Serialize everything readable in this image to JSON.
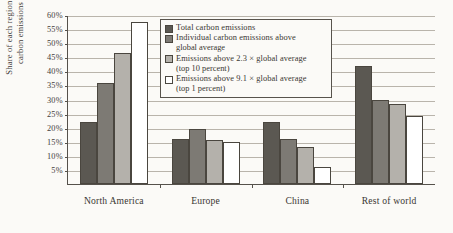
{
  "chart_data": {
    "type": "bar",
    "title": "",
    "xlabel": "",
    "ylabel": "Share of each region in carbon emissions",
    "ylabel_lines": [
      "Share of each region in",
      "carbon emissions"
    ],
    "categories": [
      "North America",
      "Europe",
      "China",
      "Rest of world"
    ],
    "ylim": [
      0,
      60
    ],
    "ytick_values": [
      60,
      55,
      50,
      45,
      40,
      35,
      30,
      25,
      20,
      15,
      10,
      5
    ],
    "ytick_labels": [
      "60%",
      "55%",
      "50%",
      "45%",
      "40%",
      "35%",
      "30%",
      "25%",
      "20%",
      "15%",
      "10%",
      "5%"
    ],
    "grid": true,
    "legend_position": "upper-center",
    "series": [
      {
        "name": "Total carbon emissions",
        "legend_lines": [
          "Total carbon emissions"
        ],
        "color": "#5b5852",
        "values": [
          22,
          16,
          22,
          42
        ]
      },
      {
        "name": "Individual carbon emissions above global average",
        "legend_lines": [
          "Individual carbon emissions above",
          "global average"
        ],
        "color": "#7d7a74",
        "values": [
          36,
          19.5,
          16,
          30
        ]
      },
      {
        "name": "Emissions above 2.3 × global average (top 10 percent)",
        "legend_lines": [
          "Emissions above 2.3 × global average",
          "(top 10 percent)"
        ],
        "color": "#b4b1ab",
        "values": [
          46.5,
          15.5,
          13,
          28.5
        ]
      },
      {
        "name": "Emissions above 9.1 × global average (top 1 percent)",
        "legend_lines": [
          "Emissions above 9.1 × global average",
          "(top 1 percent)"
        ],
        "color": "#ffffff",
        "values": [
          57.5,
          15,
          6,
          24
        ]
      }
    ]
  }
}
